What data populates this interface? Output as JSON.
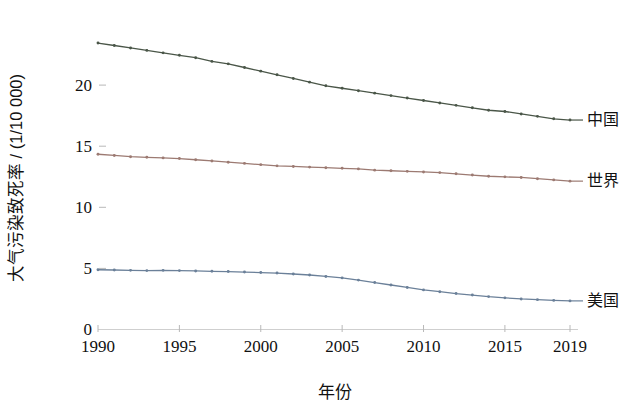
{
  "chart_data": {
    "type": "line",
    "title": "",
    "xlabel": "年份",
    "ylabel": "大气污染致死率 / (1/10 000)",
    "xlim": [
      1990,
      2019
    ],
    "ylim": [
      0,
      23.8
    ],
    "grid": false,
    "legend_position": "right-of-line-ends",
    "x_tick_labels": [
      "1990",
      "1995",
      "2000",
      "2005",
      "2010",
      "2015",
      "2019"
    ],
    "x_ticks": [
      1990,
      1995,
      2000,
      2005,
      2010,
      2015,
      2019
    ],
    "y_tick_labels": [
      "0",
      "5",
      "10",
      "15",
      "20"
    ],
    "y_ticks": [
      0,
      5,
      10,
      15,
      20
    ],
    "x": [
      1990,
      1991,
      1992,
      1993,
      1994,
      1995,
      1996,
      1997,
      1998,
      1999,
      2000,
      2001,
      2002,
      2003,
      2004,
      2005,
      2006,
      2007,
      2008,
      2009,
      2010,
      2011,
      2012,
      2013,
      2014,
      2015,
      2016,
      2017,
      2018,
      2019
    ],
    "series": [
      {
        "name": "中国",
        "color": "#4a5648",
        "marker": "circle",
        "values": [
          23.4,
          23.2,
          23.0,
          22.8,
          22.6,
          22.4,
          22.2,
          21.9,
          21.7,
          21.4,
          21.1,
          20.8,
          20.5,
          20.2,
          19.9,
          19.7,
          19.5,
          19.3,
          19.1,
          18.9,
          18.7,
          18.5,
          18.3,
          18.1,
          17.9,
          17.8,
          17.6,
          17.4,
          17.2,
          17.1
        ]
      },
      {
        "name": "世界",
        "color": "#9c7a72",
        "marker": "circle",
        "values": [
          14.3,
          14.2,
          14.1,
          14.05,
          14.0,
          13.95,
          13.85,
          13.75,
          13.65,
          13.55,
          13.45,
          13.35,
          13.3,
          13.25,
          13.2,
          13.15,
          13.1,
          13.0,
          12.95,
          12.9,
          12.85,
          12.8,
          12.7,
          12.6,
          12.5,
          12.45,
          12.4,
          12.3,
          12.2,
          12.1
        ]
      },
      {
        "name": "美国",
        "color": "#6b8099",
        "marker": "circle",
        "values": [
          4.85,
          4.83,
          4.8,
          4.78,
          4.8,
          4.78,
          4.75,
          4.72,
          4.7,
          4.66,
          4.62,
          4.58,
          4.5,
          4.42,
          4.3,
          4.18,
          4.0,
          3.8,
          3.6,
          3.4,
          3.2,
          3.05,
          2.9,
          2.78,
          2.65,
          2.55,
          2.46,
          2.4,
          2.34,
          2.3
        ]
      }
    ]
  },
  "axes": {
    "y_title": "大气污染致死率 / (1/10 000)",
    "x_title": "年份"
  },
  "series_labels": {
    "china": "中国",
    "world": "世界",
    "usa": "美国"
  },
  "colors": {
    "china": "#4a5648",
    "world": "#9c7a72",
    "usa": "#6b8099",
    "axis": "#cfcfcf",
    "text": "#111111",
    "background": "#ffffff"
  }
}
